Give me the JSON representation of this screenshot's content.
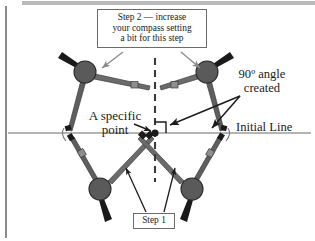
{
  "figure": {
    "title_context": "Compass construction — perpendicular at a specific point on a line",
    "colors": {
      "compass_body": "#5e5e5e",
      "compass_body_dark": "#4a4a4a",
      "compass_needle": "#1a1a1a",
      "hub_fill": "#5a5a5a",
      "hub_stroke": "#2b2b2b",
      "initial_line": "#5a5a5a",
      "dashed_line": "#3a3a3a",
      "arrow": "#1c1c1c",
      "callout_border": "#6b6b6b",
      "page_background": "#ffffff",
      "top_band": "#b9b9b9",
      "left_border": "#5a5a5a"
    },
    "geometry": {
      "center_point": [
        155,
        133
      ],
      "initial_line_y": 133,
      "initial_line_x_start": 8,
      "initial_line_x_end": 311,
      "dashed_line_x": 155,
      "dashed_line_y_top": 58,
      "dashed_line_y_bottom": 182,
      "right_angle_size": 11,
      "hubs": [
        {
          "id": "top-left",
          "x": 85,
          "y": 72,
          "r": 11
        },
        {
          "id": "top-right",
          "x": 207,
          "y": 72,
          "r": 11
        },
        {
          "id": "bottom-left",
          "x": 100,
          "y": 189,
          "r": 11
        },
        {
          "id": "bottom-right",
          "x": 192,
          "y": 189,
          "r": 11
        }
      ]
    }
  },
  "callouts": {
    "step2": {
      "lines": [
        "Step 2 — increase",
        "your compass setting",
        "a bit for this step"
      ],
      "text": "Step 2 — increase your compass setting a bit for this step"
    },
    "step1": {
      "text": "Step 1"
    }
  },
  "labels": {
    "angle": {
      "lines": [
        "90º angle",
        "created"
      ],
      "text": "90º angle created"
    },
    "specific_point": {
      "lines": [
        "A specific",
        "point"
      ],
      "text": "A specific point"
    },
    "initial_line": {
      "text": "Initial Line"
    }
  }
}
